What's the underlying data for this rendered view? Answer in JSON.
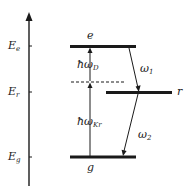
{
  "diagram": {
    "type": "energy-level-diagram",
    "axis": {
      "ticks": [
        {
          "label": "E",
          "sub": "e",
          "y": 46
        },
        {
          "label": "E",
          "sub": "r",
          "y": 92
        },
        {
          "label": "E",
          "sub": "g",
          "y": 157
        }
      ]
    },
    "levels": {
      "e": {
        "label": "e"
      },
      "r": {
        "label": "r"
      },
      "g": {
        "label": "g"
      }
    },
    "transitions": {
      "upper_photon": {
        "prefix": "ħω",
        "sub": "D"
      },
      "lower_photon": {
        "prefix": "ħω",
        "sub": "Kr"
      },
      "omega1": {
        "prefix": "ω",
        "sub": "1"
      },
      "omega2": {
        "prefix": "ω",
        "sub": "2"
      }
    },
    "colors": {
      "line": "#1a1a1a",
      "background": "#ffffff"
    }
  }
}
